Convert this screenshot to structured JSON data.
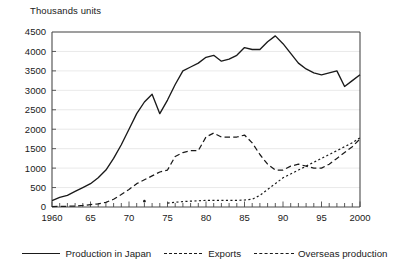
{
  "chart_data": {
    "type": "line",
    "title": "",
    "ylabel": "Thousands units",
    "xlabel": "",
    "ylim": [
      0,
      4500
    ],
    "xlim": [
      1960,
      2000
    ],
    "y_ticks": [
      0,
      500,
      1000,
      1500,
      2000,
      2500,
      3000,
      3500,
      4000,
      4500
    ],
    "x_ticks": [
      1960,
      1965,
      1970,
      1975,
      1980,
      1985,
      1990,
      1995,
      2000
    ],
    "x_tick_labels": [
      "1960",
      "65",
      "70",
      "75",
      "80",
      "85",
      "90",
      "95",
      "2000"
    ],
    "x_minor_tick_interval": 1,
    "grid": "horizontal",
    "legend_position": "bottom",
    "x": [
      1960,
      1961,
      1962,
      1963,
      1964,
      1965,
      1966,
      1967,
      1968,
      1969,
      1970,
      1971,
      1972,
      1973,
      1974,
      1975,
      1976,
      1977,
      1978,
      1979,
      1980,
      1981,
      1982,
      1983,
      1984,
      1985,
      1986,
      1987,
      1988,
      1989,
      1990,
      1991,
      1992,
      1993,
      1994,
      1995,
      1996,
      1997,
      1998,
      1999,
      2000
    ],
    "series": [
      {
        "name": "Production in Japan",
        "style": "solid",
        "color": "#1a1a1a",
        "values": [
          165,
          250,
          300,
          400,
          500,
          600,
          750,
          950,
          1250,
          1600,
          2000,
          2400,
          2700,
          2900,
          2400,
          2750,
          3150,
          3500,
          3600,
          3700,
          3850,
          3900,
          3750,
          3800,
          3900,
          4100,
          4050,
          4050,
          4250,
          4400,
          4200,
          3950,
          3700,
          3550,
          3450,
          3400,
          3450,
          3500,
          3100,
          3250,
          3400
        ]
      },
      {
        "name": "Exports",
        "style": "dashed",
        "color": "#1a1a1a",
        "values": [
          12,
          15,
          20,
          25,
          40,
          60,
          80,
          120,
          200,
          320,
          450,
          600,
          700,
          800,
          900,
          950,
          1300,
          1400,
          1450,
          1450,
          1800,
          1900,
          1800,
          1800,
          1800,
          1850,
          1650,
          1350,
          1100,
          950,
          950,
          1050,
          1100,
          1050,
          1000,
          1000,
          1100,
          1250,
          1400,
          1550,
          1750
        ]
      },
      {
        "name": "Overseas production",
        "style": "dotted",
        "color": "#1a1a1a",
        "values": [
          null,
          null,
          null,
          null,
          null,
          null,
          null,
          null,
          null,
          null,
          null,
          null,
          150,
          null,
          null,
          100,
          120,
          140,
          150,
          160,
          170,
          170,
          170,
          170,
          170,
          180,
          200,
          300,
          450,
          600,
          750,
          850,
          950,
          1050,
          1150,
          1250,
          1350,
          1450,
          1550,
          1650,
          1780
        ]
      }
    ]
  },
  "legend": {
    "items": [
      {
        "label": "Production in Japan",
        "style": "solid"
      },
      {
        "label": "Exports",
        "style": "dashed"
      },
      {
        "label": "Overseas production",
        "style": "dotted"
      }
    ]
  }
}
